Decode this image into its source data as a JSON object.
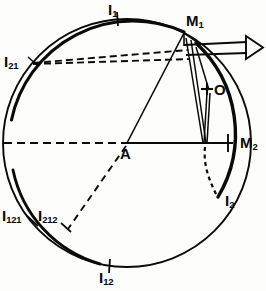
{
  "figure": {
    "kind": "geometric-optics-diagram",
    "stroke_color": "#0a0a0a",
    "background_color": "#fdfdfb"
  },
  "geometry": {
    "circle": {
      "cx": 127,
      "cy": 143,
      "r": 124
    },
    "points": {
      "A": {
        "x": 127,
        "y": 143
      },
      "O": {
        "x": 208,
        "y": 90
      },
      "M1": {
        "x": 184,
        "y": 32
      },
      "M2": {
        "x": 228,
        "y": 143
      },
      "I1": {
        "x": 117,
        "y": 19
      },
      "I21": {
        "x": 33,
        "y": 62
      },
      "I121": {
        "x": 32,
        "y": 222
      },
      "I212": {
        "x": 66,
        "y": 228
      },
      "I12": {
        "x": 109,
        "y": 266
      },
      "I2": {
        "x": 218,
        "y": 196
      }
    }
  },
  "labels": {
    "I1": {
      "base": "I",
      "sub": "1",
      "x": 108,
      "y": 2
    },
    "I21": {
      "base": "I",
      "sub": "21",
      "x": 4,
      "y": 54
    },
    "I121": {
      "base": "I",
      "sub": "121",
      "x": 2,
      "y": 208
    },
    "I212": {
      "base": "I",
      "sub": "212",
      "x": 38,
      "y": 208
    },
    "I12": {
      "base": "I",
      "sub": "12",
      "x": 99,
      "y": 270
    },
    "I2": {
      "base": "I",
      "sub": "2",
      "x": 225,
      "y": 193
    },
    "M1": {
      "base": "M",
      "sub": "1",
      "x": 186,
      "y": 13
    },
    "M2": {
      "base": "M",
      "sub": "2",
      "x": 240,
      "y": 135
    },
    "A": {
      "base": "A",
      "sub": "",
      "x": 120,
      "y": 146
    },
    "O": {
      "base": "O",
      "sub": "",
      "x": 214,
      "y": 82
    }
  },
  "marks": {
    "tick_I1": "radial-tick",
    "tick_I12": "radial-tick",
    "tick_I121": "radial-tick",
    "tick_I212": "radial-tick",
    "tick_M2": "radial-tick",
    "marker_O": "cross"
  },
  "elements": {
    "outgoing_beam": "hollow-arrow-right",
    "dashed_lines": [
      "I21-to-beam-upper",
      "I21-to-beam-lower",
      "A-horizontal-left",
      "A-to-I212",
      "M2-to-I2"
    ],
    "solid_rays": [
      "A-to-M1",
      "A-to-M2",
      "M1-to-M2-bundle",
      "O-to-M2-bundle"
    ]
  }
}
